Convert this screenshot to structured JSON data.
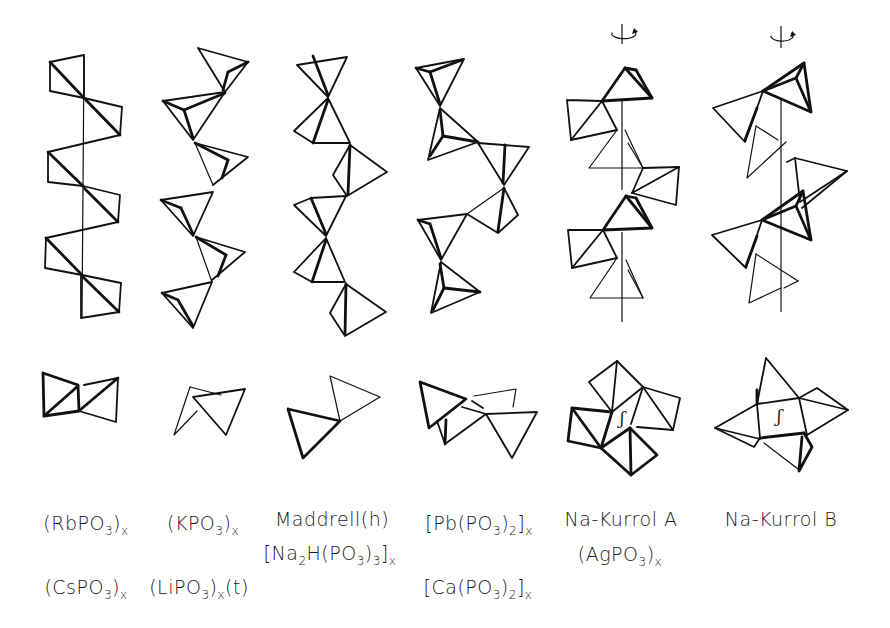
{
  "figure": {
    "colors": {
      "ink": "#111111",
      "background": "#ffffff"
    },
    "columns": [
      {
        "id": "rbpo3",
        "labels": [
          {
            "formula": "(RbPO3)x",
            "html": "(RbPO<sub>3</sub>)<sub>x</sub>"
          },
          {
            "formula": "(CsPO3)x",
            "html": "(CsPO<sub>3</sub>)<sub>x</sub>"
          }
        ]
      },
      {
        "id": "kpo3",
        "labels": [
          {
            "formula": "(KPO3)x",
            "html": "(KPO<sub>3</sub>)<sub>x</sub>"
          },
          {
            "formula": "(LiPO3)x(t)",
            "html": "(LiPO<sub>3</sub>)<sub>x</sub>(t)"
          }
        ]
      },
      {
        "id": "maddrell",
        "labels": [
          {
            "formula": "Maddrell(h)",
            "html": "Maddrell(h)"
          },
          {
            "formula": "[Na2H(PO3)3]x",
            "html": "[Na<sub>2</sub>H(PO<sub>3</sub>)<sub>3</sub>]<sub>x</sub>"
          }
        ]
      },
      {
        "id": "pb",
        "labels": [
          {
            "formula": "[Pb(PO3)2]x",
            "html": "[Pb(PO<sub>3</sub>)<sub>2</sub>]<sub>x</sub>"
          },
          {
            "formula": "[Ca(PO3)2]x",
            "html": "[Ca(PO<sub>3</sub>)<sub>2</sub>]<sub>x</sub>"
          }
        ]
      },
      {
        "id": "nakurrol-a",
        "labels": [
          {
            "formula": "Na-Kurrol A",
            "html": "Na-Kurrol A"
          },
          {
            "formula": "(AgPO3)x",
            "html": "(AgPO<sub>3</sub>)<sub>x</sub>"
          }
        ]
      },
      {
        "id": "nakurrol-b",
        "labels": [
          {
            "formula": "Na-Kurrol B",
            "html": "Na-Kurrol B"
          }
        ]
      }
    ],
    "symbols": {
      "rotation_axis": "screw axis with rotation arrow",
      "screw_marker": "ʃ"
    }
  }
}
